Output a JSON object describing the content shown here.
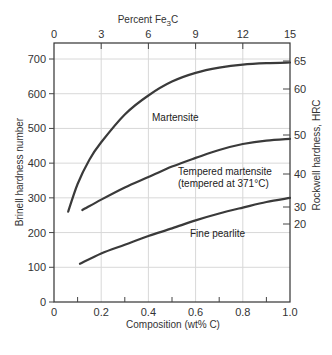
{
  "chart_data": {
    "type": "line",
    "title": "",
    "top_axis": {
      "label": "Percent Fe3C",
      "ticks": [
        0,
        3,
        6,
        9,
        12,
        15
      ]
    },
    "xlabel": "Composition (wt% C)",
    "xlim": [
      0,
      1.0
    ],
    "xticks": [
      "0",
      "0.2",
      "0.4",
      "0.6",
      "0.8",
      "1.0"
    ],
    "ylabel": "Brinell hardness number",
    "ylim": [
      0,
      700
    ],
    "yticks": [
      "0",
      "100",
      "200",
      "300",
      "400",
      "500",
      "600",
      "700"
    ],
    "right_axis": {
      "label": "Rockwell hardness, HRC",
      "ticks": [
        {
          "label": "65",
          "brinell": 688
        },
        {
          "label": "60",
          "brinell": 610
        },
        {
          "label": "50",
          "brinell": 480
        },
        {
          "label": "40",
          "brinell": 370
        },
        {
          "label": "30",
          "brinell": 275
        },
        {
          "label": "20",
          "brinell": 225
        }
      ]
    },
    "grid": true,
    "series": [
      {
        "name": "Martensite",
        "x": [
          0.06,
          0.1,
          0.15,
          0.2,
          0.3,
          0.4,
          0.5,
          0.6,
          0.7,
          0.8,
          0.9,
          1.0
        ],
        "values": [
          260,
          340,
          410,
          460,
          540,
          595,
          635,
          660,
          675,
          684,
          688,
          690
        ]
      },
      {
        "name": "Tempered martensite (tempered at 371°C)",
        "x": [
          0.12,
          0.2,
          0.3,
          0.4,
          0.5,
          0.6,
          0.7,
          0.8,
          0.9,
          1.0
        ],
        "values": [
          265,
          295,
          330,
          360,
          390,
          415,
          438,
          455,
          465,
          470
        ]
      },
      {
        "name": "Fine pearlite",
        "x": [
          0.11,
          0.2,
          0.3,
          0.4,
          0.5,
          0.6,
          0.7,
          0.8,
          0.9,
          1.0
        ],
        "values": [
          110,
          140,
          165,
          190,
          212,
          235,
          255,
          272,
          288,
          300
        ]
      }
    ],
    "annotations": [
      {
        "text": "Martensite",
        "x": 0.5,
        "y": 560
      },
      {
        "text": "Tempered martensite",
        "x": 0.6,
        "y": 375
      },
      {
        "text": "(tempered at 371°C)",
        "x": 0.6,
        "y": 345
      },
      {
        "text": "Fine pearlite",
        "x": 0.55,
        "y": 160
      }
    ]
  },
  "labels": {
    "top_axis_title": "Percent Fe",
    "top_axis_sub": "3",
    "top_axis_suffix": "C",
    "x_axis_title": "Composition (wt% C)",
    "y_axis_title": "Brinell hardness number",
    "y2_axis_title": "Rockwell hardness, HRC",
    "curve_martensite": "Martensite",
    "curve_tempered_1": "Tempered martensite",
    "curve_tempered_2": "(tempered at 371°C)",
    "curve_pearlite": "Fine pearlite"
  }
}
